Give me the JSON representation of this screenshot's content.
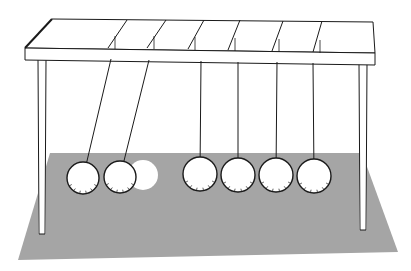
{
  "image": {
    "subject": "Newton's cradle illustration",
    "width": 411,
    "height": 271
  },
  "colors": {
    "background": "#ffffff",
    "shadow": "#a5a5a5",
    "ink": "#1a1a1a",
    "ball_fill": "#ffffff",
    "ghost_ball": "#ffffff"
  },
  "frame": {
    "top_bar": {
      "front_left": [
        25,
        48
      ],
      "back_left": [
        52,
        19
      ],
      "back_right": [
        373,
        22
      ],
      "front_right": [
        375,
        53
      ],
      "thickness": 12
    },
    "legs": [
      {
        "name": "left-leg",
        "x1": 38,
        "x2": 46,
        "top": 60,
        "bottom": 234
      },
      {
        "name": "right-leg",
        "x1": 359,
        "x2": 367,
        "top": 64,
        "bottom": 230
      }
    ],
    "top_dividers": [
      [
        [
          127,
          20
        ],
        [
          108,
          48
        ]
      ],
      [
        [
          166,
          20
        ],
        [
          147,
          48
        ]
      ],
      [
        [
          204,
          20
        ],
        [
          188,
          49
        ]
      ],
      [
        [
          240,
          20
        ],
        [
          228,
          50
        ]
      ],
      [
        [
          283,
          21
        ],
        [
          272,
          51
        ]
      ],
      [
        [
          322,
          21
        ],
        [
          313,
          52
        ]
      ]
    ]
  },
  "balls": [
    {
      "name": "ball-1-swung",
      "cx": 83,
      "cy": 178,
      "r": 16,
      "string_from": [
        111,
        59
      ]
    },
    {
      "name": "ball-2-swung",
      "cx": 120,
      "cy": 177,
      "r": 16,
      "string_from": [
        149,
        60
      ]
    },
    {
      "name": "ball-3",
      "cx": 200,
      "cy": 174,
      "r": 17,
      "string_from": [
        201,
        61
      ]
    },
    {
      "name": "ball-4",
      "cx": 238,
      "cy": 175,
      "r": 17,
      "string_from": [
        238,
        62
      ]
    },
    {
      "name": "ball-5",
      "cx": 276,
      "cy": 175,
      "r": 17,
      "string_from": [
        277,
        62
      ]
    },
    {
      "name": "ball-6",
      "cx": 314,
      "cy": 176,
      "r": 17,
      "string_from": [
        313,
        63
      ]
    }
  ],
  "ghost_ball": {
    "cx": 143,
    "cy": 175,
    "r": 15
  },
  "shadow_polygon": [
    [
      50,
      153
    ],
    [
      362,
      153
    ],
    [
      398,
      252
    ],
    [
      18,
      260
    ]
  ]
}
